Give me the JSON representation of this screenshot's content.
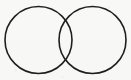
{
  "figure": {
    "type": "venn",
    "width": 131,
    "height": 80,
    "background_color": "#f8f8f7",
    "stroke_color": "#1f1f1f",
    "stroke_width": 1.6,
    "fill": "none",
    "caption": "",
    "labels": []
  },
  "chart_data": {
    "type": "diagram",
    "subtype": "venn-2set",
    "title": "",
    "xlabel": "",
    "ylabel": "",
    "grid": false,
    "legend": "none",
    "annotations": [],
    "circles": [
      {
        "id": "left-circle",
        "label": "",
        "cx": 38.5,
        "cy": 40.0,
        "r": 33.5,
        "stroke": "#1f1f1f",
        "stroke_width": 1.6,
        "fill": "none"
      },
      {
        "id": "right-circle",
        "label": "",
        "cx": 92.5,
        "cy": 40.0,
        "r": 33.5,
        "stroke": "#1f1f1f",
        "stroke_width": 1.6,
        "fill": "none"
      }
    ],
    "intersections": [
      {
        "x": 65.5,
        "y": 20.0
      },
      {
        "x": 65.5,
        "y": 60.0
      }
    ],
    "overlap_region": {
      "id": "lens",
      "label": "",
      "shaded": false,
      "fill": "none"
    },
    "center_distance": 54.0,
    "radius": 33.5
  }
}
